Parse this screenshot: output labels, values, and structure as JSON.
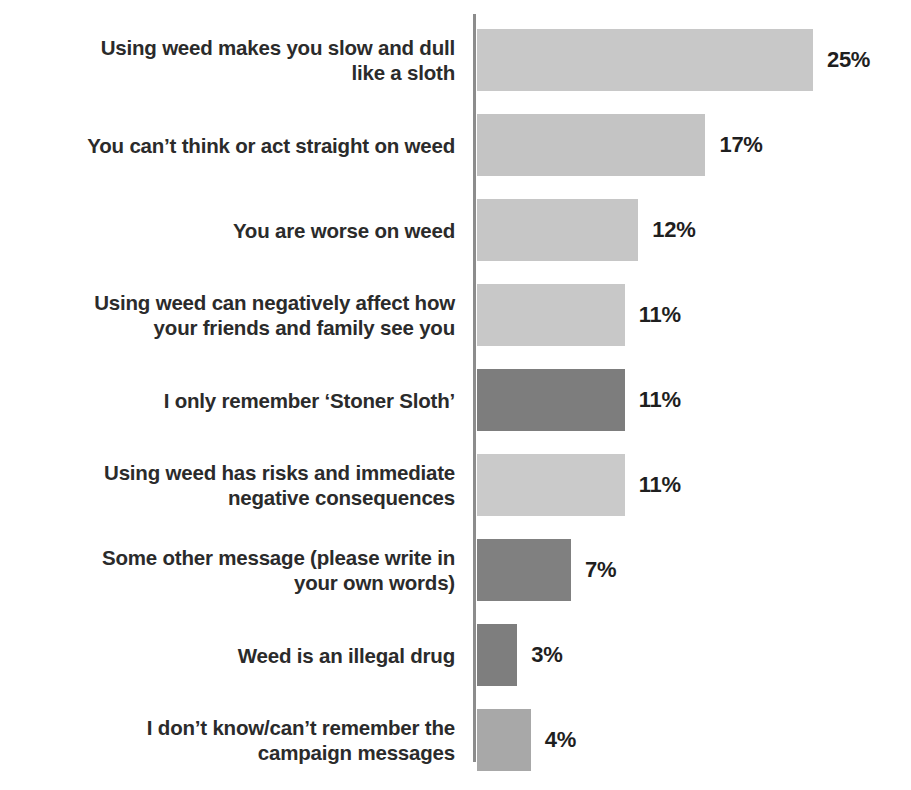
{
  "chart_data": {
    "type": "bar",
    "orientation": "horizontal",
    "title": "",
    "subtitle": "",
    "xlabel": "",
    "ylabel": "",
    "xlim": [
      0,
      25
    ],
    "grid": false,
    "legend": null,
    "value_suffix": "%",
    "categories": [
      "Using weed makes you slow and dull like a sloth",
      "You can’t think or act straight on weed",
      "You are worse on weed",
      "Using weed can negatively affect how your friends and family see you",
      "I only remember ‘Stoner Sloth’",
      "Using weed has risks and immediate negative consequences",
      "Some other message (please write in your own words)",
      "Weed is an illegal drug",
      "I don’t know/can’t remember the campaign messages"
    ],
    "values": [
      25,
      17,
      12,
      11,
      11,
      11,
      7,
      3,
      4
    ],
    "value_labels": [
      "25%",
      "17%",
      "12%",
      "11%",
      "11%",
      "11%",
      "7%",
      "3%",
      "4%"
    ],
    "bar_colors": [
      "#c8c8c8",
      "#c4c4c4",
      "#c6c6c6",
      "#c8c8c8",
      "#7d7d7d",
      "#cacaca",
      "#808080",
      "#7e7e7e",
      "#a8a8a8"
    ],
    "palette": {
      "light_gray": "#c8c8c8",
      "mid_gray": "#a8a8a8",
      "dark_gray": "#7d7d7d",
      "axis_gray": "#8c8c8c",
      "text_dark": "#2b2b2b",
      "background": "#ffffff"
    },
    "bars": [
      {
        "label": "Using weed makes you slow and dull like a sloth",
        "label_line_1": "Using weed makes you slow and dull",
        "label_line_2": "like a sloth",
        "value": 25,
        "value_label": "25%",
        "color": "#c8c8c8"
      },
      {
        "label": "You can’t think or act straight on weed",
        "label_line_1": "You can’t think or act straight on weed",
        "label_line_2": "",
        "value": 17,
        "value_label": "17%",
        "color": "#c4c4c4"
      },
      {
        "label": "You are worse on weed",
        "label_line_1": "You are worse on weed",
        "label_line_2": "",
        "value": 12,
        "value_label": "12%",
        "color": "#c6c6c6"
      },
      {
        "label": "Using weed can negatively affect how your friends and family see you",
        "label_line_1": "Using weed can negatively affect how",
        "label_line_2": "your friends and family see you",
        "value": 11,
        "value_label": "11%",
        "color": "#c8c8c8"
      },
      {
        "label": "I only remember ‘Stoner Sloth’",
        "label_line_1": "I only remember ‘Stoner Sloth’",
        "label_line_2": "",
        "value": 11,
        "value_label": "11%",
        "color": "#7d7d7d"
      },
      {
        "label": "Using weed has risks and immediate negative consequences",
        "label_line_1": "Using weed has risks and immediate",
        "label_line_2": "negative consequences",
        "value": 11,
        "value_label": "11%",
        "color": "#cacaca"
      },
      {
        "label": "Some other message (please write in your own words)",
        "label_line_1": "Some other message (please write in",
        "label_line_2": "your own words)",
        "value": 7,
        "value_label": "7%",
        "color": "#808080"
      },
      {
        "label": "Weed is an illegal drug",
        "label_line_1": "Weed is an illegal drug",
        "label_line_2": "",
        "value": 3,
        "value_label": "3%",
        "color": "#7e7e7e"
      },
      {
        "label": "I don’t know/can’t remember the campaign messages",
        "label_line_1": "I don’t know/can’t remember the",
        "label_line_2": "campaign messages",
        "value": 4,
        "value_label": "4%",
        "color": "#a8a8a8"
      }
    ]
  },
  "layout": {
    "axis_x": 473,
    "bar_origin_x": 477,
    "px_per_unit": 13.44,
    "row_top_start": 29,
    "row_pitch": 85,
    "bar_height": 62,
    "value_gap": 14
  }
}
